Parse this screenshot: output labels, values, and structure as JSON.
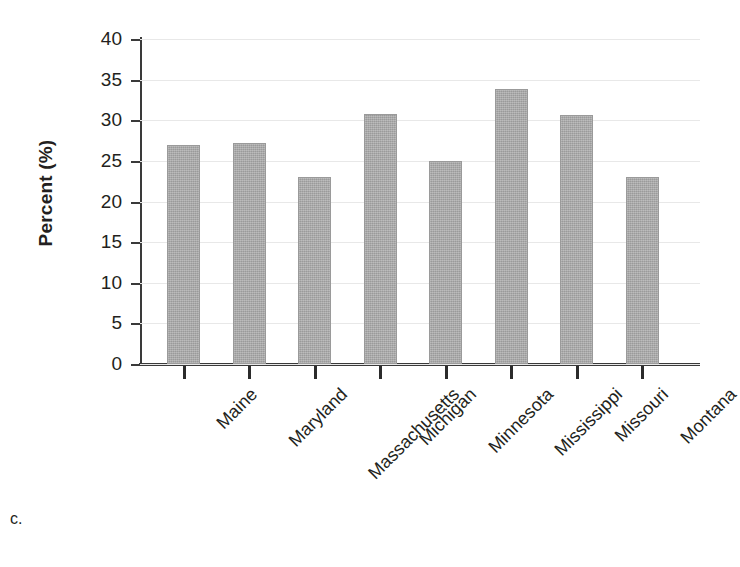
{
  "panel": {
    "letter": "c."
  },
  "chart_data": {
    "type": "bar",
    "title": "",
    "xlabel": "",
    "ylabel": "Percent (%)",
    "ylim": [
      0,
      40
    ],
    "ytick_step": 5,
    "yticks": [
      "40",
      "35",
      "30",
      "25",
      "20",
      "15",
      "10",
      "5",
      "0"
    ],
    "grid": true,
    "grid_axis": "y",
    "legend": "none",
    "xtick_rotation": -45,
    "bar_color": "#a9a9a9",
    "categories": [
      "Maine",
      "Maryland",
      "Massachusetts",
      "Michigan",
      "Minnesota",
      "Mississippi",
      "Missouri",
      "Montana"
    ],
    "values": [
      26.9,
      27.2,
      23.0,
      30.8,
      25.0,
      33.9,
      30.6,
      23.0
    ]
  }
}
